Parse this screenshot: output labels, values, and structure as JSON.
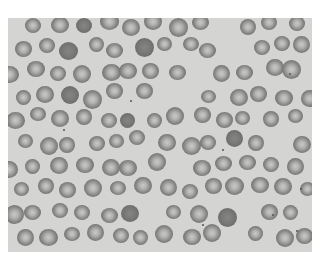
{
  "image": {
    "subject": "blood smear micrograph showing red blood cells",
    "background_color": "#ffffff",
    "field_color": "#d4d4d2",
    "cell_color": "#7a7a78",
    "grid": {
      "cols": 13,
      "rows": 10,
      "cell_size": 17,
      "pitch_x": 23.5,
      "pitch_y": 23.5
    }
  }
}
